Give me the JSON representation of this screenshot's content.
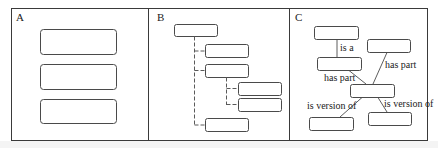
{
  "figure": {
    "panels": [
      {
        "id": "A",
        "label": "A",
        "description": "three stacked unconnected boxes",
        "nodes": [
          {
            "x": 40,
            "y": 29,
            "w": 76,
            "h": 25
          },
          {
            "x": 40,
            "y": 64,
            "w": 76,
            "h": 25
          },
          {
            "x": 40,
            "y": 99,
            "w": 76,
            "h": 24
          }
        ]
      },
      {
        "id": "B",
        "label": "B",
        "description": "tree hierarchy with dashed connectors",
        "nodes": [
          {
            "id": "root",
            "x": 174,
            "y": 24,
            "w": 43,
            "h": 12
          },
          {
            "id": "c1",
            "x": 205,
            "y": 44,
            "w": 43,
            "h": 13
          },
          {
            "id": "c2",
            "x": 205,
            "y": 64,
            "w": 43,
            "h": 13
          },
          {
            "id": "g1",
            "x": 238,
            "y": 82,
            "w": 43,
            "h": 13
          },
          {
            "id": "g2",
            "x": 238,
            "y": 98,
            "w": 43,
            "h": 13
          },
          {
            "id": "c3",
            "x": 205,
            "y": 118,
            "w": 43,
            "h": 13
          }
        ]
      },
      {
        "id": "C",
        "label": "C",
        "description": "graph with labeled relations",
        "nodes": [
          {
            "id": "n1",
            "x": 314,
            "y": 26,
            "w": 44,
            "h": 13
          },
          {
            "id": "n2",
            "x": 367,
            "y": 39,
            "w": 43,
            "h": 13
          },
          {
            "id": "n3",
            "x": 317,
            "y": 57,
            "w": 44,
            "h": 13
          },
          {
            "id": "n4",
            "x": 350,
            "y": 84,
            "w": 44,
            "h": 13
          },
          {
            "id": "n5",
            "x": 309,
            "y": 117,
            "w": 44,
            "h": 13
          },
          {
            "id": "n6",
            "x": 368,
            "y": 112,
            "w": 43,
            "h": 13
          }
        ],
        "edges": [
          {
            "from": "n1",
            "to": "n3",
            "label": "is a"
          },
          {
            "from": "n3",
            "to": "n4",
            "label": "has part"
          },
          {
            "from": "n2",
            "to": "n4",
            "label": "has part"
          },
          {
            "from": "n4",
            "to": "n5",
            "label": "is version of"
          },
          {
            "from": "n4",
            "to": "n6",
            "label": "is version of"
          }
        ]
      }
    ]
  },
  "labels": {
    "panel_a": "A",
    "panel_b": "B",
    "panel_c": "C",
    "edge_is_a": "is a",
    "edge_has_part_left": "has part",
    "edge_has_part_right": "has part",
    "edge_version_left": "is version of",
    "edge_version_right": "is version of"
  }
}
